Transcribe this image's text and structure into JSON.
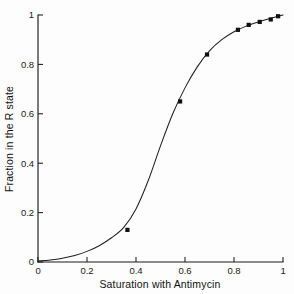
{
  "chart_data": {
    "type": "scatter",
    "title": "",
    "xlabel": "Saturation with Antimycin",
    "ylabel": "Fraction in the R state",
    "xlim": [
      0,
      1
    ],
    "ylim": [
      0,
      1
    ],
    "grid": false,
    "legend": "none",
    "xticks": [
      "0",
      "0.2",
      "0.4",
      "0.6",
      "0.8",
      "1"
    ],
    "xtick_values": [
      0,
      0.2,
      0.4,
      0.6,
      0.8,
      1
    ],
    "yticks": [
      "0",
      "0.2",
      "0.4",
      "0.6",
      "0.8",
      "1"
    ],
    "ytick_values": [
      0,
      0.2,
      0.4,
      0.6,
      0.8,
      1
    ],
    "series": [
      {
        "name": "measured data",
        "marker": "filled-square",
        "x": [
          0.365,
          0.58,
          0.69,
          0.816,
          0.86,
          0.905,
          0.95,
          0.98
        ],
        "y": [
          0.13,
          0.65,
          0.84,
          0.94,
          0.96,
          0.972,
          0.982,
          0.995
        ]
      },
      {
        "name": "fitted curve",
        "marker": "none",
        "x": [
          0.0,
          0.05,
          0.1,
          0.15,
          0.2,
          0.25,
          0.3,
          0.35,
          0.4,
          0.45,
          0.5,
          0.55,
          0.6,
          0.65,
          0.7,
          0.75,
          0.8,
          0.85,
          0.9,
          0.95,
          1.0
        ],
        "y": [
          0.004,
          0.008,
          0.015,
          0.026,
          0.043,
          0.066,
          0.098,
          0.14,
          0.215,
          0.33,
          0.47,
          0.6,
          0.705,
          0.79,
          0.855,
          0.9,
          0.932,
          0.955,
          0.972,
          0.987,
          1.0
        ]
      }
    ]
  }
}
